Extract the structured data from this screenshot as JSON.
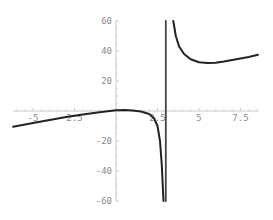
{
  "chart_data": {
    "type": "line",
    "title": "",
    "xlabel": "",
    "ylabel": "",
    "xlim": [
      -6.2,
      8.6
    ],
    "ylim": [
      -60,
      60
    ],
    "grid": false,
    "x_ticks": [
      -5,
      -2.5,
      2.5,
      5,
      7.5
    ],
    "x_tick_labels": [
      "-5",
      "2.5",
      "2.5",
      "5",
      "7.5"
    ],
    "y_ticks": [
      60,
      40,
      20,
      -20,
      -40,
      -60
    ],
    "y_tick_labels": [
      "60",
      "40",
      "20",
      "-20",
      "-40",
      "-60"
    ],
    "vertical_asymptote": 3,
    "series": [
      {
        "name": "left branch",
        "color": "#222222",
        "points": [
          [
            -6.2,
            -10.5
          ],
          [
            -5,
            -8
          ],
          [
            -4,
            -6
          ],
          [
            -3,
            -4
          ],
          [
            -2,
            -2.3
          ],
          [
            -1,
            -0.8
          ],
          [
            0,
            0.5
          ],
          [
            0.5,
            0.6
          ],
          [
            1,
            0.4
          ],
          [
            1.5,
            -0.3
          ],
          [
            2,
            -2
          ],
          [
            2.3,
            -5
          ],
          [
            2.5,
            -10
          ],
          [
            2.65,
            -20
          ],
          [
            2.75,
            -35
          ],
          [
            2.82,
            -50
          ],
          [
            2.86,
            -60
          ]
        ]
      },
      {
        "name": "right branch",
        "color": "#222222",
        "points": [
          [
            3.45,
            60
          ],
          [
            3.6,
            50
          ],
          [
            3.8,
            43
          ],
          [
            4.1,
            38
          ],
          [
            4.5,
            34.5
          ],
          [
            5,
            32.5
          ],
          [
            5.5,
            32
          ],
          [
            6,
            32.2
          ],
          [
            6.5,
            33
          ],
          [
            7,
            34
          ],
          [
            7.5,
            35
          ],
          [
            8,
            36
          ],
          [
            8.55,
            37.5
          ]
        ]
      },
      {
        "name": "asymptote line",
        "color": "#444444",
        "points": [
          [
            3,
            60
          ],
          [
            3,
            -60
          ]
        ]
      }
    ]
  },
  "colors": {
    "axis": "#c8c8c8",
    "tick_text": "#8a8a8a",
    "curve": "#222222"
  }
}
